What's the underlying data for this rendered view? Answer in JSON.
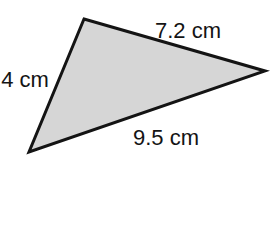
{
  "figure": {
    "type": "triangle-diagram",
    "labels": {
      "top_side": "7.2 cm",
      "left_side": "4 cm",
      "bottom_side": "9.5 cm"
    },
    "colors": {
      "fill": "#d6d6d6",
      "stroke": "#141414",
      "text": "#141414",
      "background": "#ffffff"
    }
  }
}
